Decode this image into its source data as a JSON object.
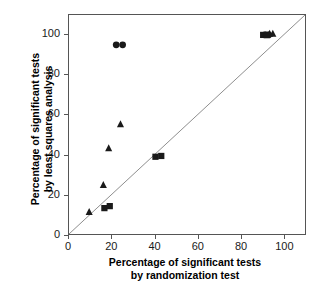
{
  "figure": {
    "top_artifact_text": "",
    "frame_color": "#555555",
    "marker_color": "#1a1a1a",
    "reference_line_color": "#808080"
  },
  "axes": {
    "x": {
      "label_line1": "Percentage of significant tests",
      "label_line2": "by randomization test",
      "ticks": [
        0,
        20,
        40,
        60,
        80,
        100
      ],
      "tick_labels": [
        "0",
        "20",
        "40",
        "60",
        "80",
        "100"
      ],
      "min": 0,
      "max": 110
    },
    "y": {
      "label_line1": "Percentage of significant tests",
      "label_line2": "by least squares analysis",
      "ticks": [
        0,
        20,
        40,
        60,
        80,
        100
      ],
      "tick_labels": [
        "0",
        "20",
        "40",
        "60",
        "80",
        "100"
      ],
      "min": 0,
      "max": 110
    }
  },
  "chart_data": {
    "type": "scatter",
    "title": "",
    "xlabel": "Percentage of significant tests by randomization test",
    "ylabel": "Percentage of significant tests by least squares analysis",
    "xlim": [
      0,
      110
    ],
    "ylim": [
      0,
      110
    ],
    "xticks": [
      0,
      20,
      40,
      60,
      80,
      100
    ],
    "yticks": [
      0,
      20,
      40,
      60,
      80,
      100
    ],
    "grid": false,
    "legend": "none",
    "annotations": [
      {
        "name": "identity-line",
        "type": "line",
        "from": [
          0,
          0
        ],
        "to": [
          110,
          110
        ],
        "note": "1:1 reference line"
      }
    ],
    "series": [
      {
        "name": "circle-series",
        "marker": "circle",
        "color": "#1a1a1a",
        "points": [
          [
            22.0,
            95.0
          ],
          [
            25.0,
            95.0
          ],
          [
            91.5,
            100.0
          ],
          [
            93.0,
            100.0
          ]
        ]
      },
      {
        "name": "triangle-series",
        "marker": "triangle",
        "color": "#1a1a1a",
        "points": [
          [
            9.4,
            11.0
          ],
          [
            16.0,
            24.5
          ],
          [
            18.5,
            43.0
          ],
          [
            24.0,
            55.0
          ],
          [
            93.5,
            100.5
          ],
          [
            95.0,
            100.5
          ]
        ]
      },
      {
        "name": "square-series",
        "marker": "square",
        "color": "#1a1a1a",
        "points": [
          [
            16.5,
            13.0
          ],
          [
            19.0,
            14.0
          ],
          [
            40.3,
            38.8
          ],
          [
            43.0,
            39.2
          ],
          [
            90.5,
            100.0
          ],
          [
            92.0,
            100.0
          ]
        ]
      }
    ]
  }
}
